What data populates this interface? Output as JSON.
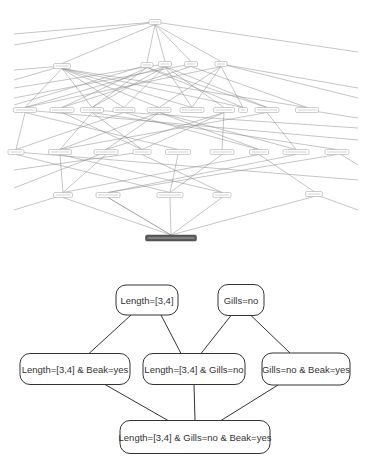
{
  "overview_lattice": {
    "description": "Full concept lattice (labels illegible at this scale)",
    "root": {
      "id": "r0",
      "x": 155,
      "y": 22,
      "w": 12,
      "h": 5,
      "label": ""
    },
    "rows": [
      [
        {
          "id": "a1",
          "x": 62,
          "y": 66,
          "w": 17,
          "h": 5,
          "label": ""
        },
        {
          "id": "a2",
          "x": 147,
          "y": 65,
          "w": 12,
          "h": 5,
          "label": ""
        },
        {
          "id": "a3",
          "x": 165,
          "y": 64,
          "w": 13,
          "h": 5,
          "label": ""
        },
        {
          "id": "a4",
          "x": 191,
          "y": 64,
          "w": 13,
          "h": 5,
          "label": ""
        },
        {
          "id": "a5",
          "x": 221,
          "y": 64,
          "w": 12,
          "h": 5,
          "label": ""
        }
      ],
      [
        {
          "id": "b1",
          "x": 25,
          "y": 110,
          "w": 23,
          "h": 5,
          "label": ""
        },
        {
          "id": "b2",
          "x": 62,
          "y": 110,
          "w": 24,
          "h": 5,
          "label": ""
        },
        {
          "id": "b3",
          "x": 92,
          "y": 110,
          "w": 23,
          "h": 5,
          "label": ""
        },
        {
          "id": "b4",
          "x": 124,
          "y": 110,
          "w": 22,
          "h": 5,
          "label": ""
        },
        {
          "id": "b5",
          "x": 159,
          "y": 110,
          "w": 24,
          "h": 5,
          "label": ""
        },
        {
          "id": "b6",
          "x": 192,
          "y": 110,
          "w": 24,
          "h": 5,
          "label": ""
        },
        {
          "id": "b7",
          "x": 224,
          "y": 110,
          "w": 21,
          "h": 5,
          "label": ""
        },
        {
          "id": "b8",
          "x": 243,
          "y": 110,
          "w": 9,
          "h": 5,
          "label": ""
        },
        {
          "id": "b9",
          "x": 267,
          "y": 110,
          "w": 24,
          "h": 5,
          "label": ""
        },
        {
          "id": "b10",
          "x": 307,
          "y": 110,
          "w": 23,
          "h": 5,
          "label": ""
        }
      ],
      [
        {
          "id": "c1",
          "x": 16,
          "y": 152,
          "w": 16,
          "h": 5,
          "label": ""
        },
        {
          "id": "c2",
          "x": 60,
          "y": 152,
          "w": 23,
          "h": 5,
          "label": ""
        },
        {
          "id": "c3",
          "x": 106,
          "y": 152,
          "w": 24,
          "h": 5,
          "label": ""
        },
        {
          "id": "c4",
          "x": 142,
          "y": 152,
          "w": 18,
          "h": 5,
          "label": ""
        },
        {
          "id": "c5",
          "x": 178,
          "y": 152,
          "w": 25,
          "h": 5,
          "label": ""
        },
        {
          "id": "c6",
          "x": 222,
          "y": 152,
          "w": 24,
          "h": 5,
          "label": ""
        },
        {
          "id": "c7",
          "x": 259,
          "y": 152,
          "w": 19,
          "h": 5,
          "label": ""
        },
        {
          "id": "c8",
          "x": 296,
          "y": 152,
          "w": 26,
          "h": 5,
          "label": ""
        },
        {
          "id": "c9",
          "x": 337,
          "y": 152,
          "w": 24,
          "h": 5,
          "label": ""
        }
      ],
      [
        {
          "id": "d1",
          "x": 63,
          "y": 195,
          "w": 19,
          "h": 5,
          "label": ""
        },
        {
          "id": "d2",
          "x": 108,
          "y": 195,
          "w": 24,
          "h": 5,
          "label": ""
        },
        {
          "id": "d3",
          "x": 170,
          "y": 195,
          "w": 26,
          "h": 5,
          "label": ""
        },
        {
          "id": "d4",
          "x": 222,
          "y": 195,
          "w": 18,
          "h": 5,
          "label": ""
        },
        {
          "id": "d5",
          "x": 314,
          "y": 194,
          "w": 17,
          "h": 5,
          "label": ""
        }
      ]
    ],
    "bottom": {
      "id": "z0",
      "x": 171,
      "y": 238,
      "w": 51,
      "h": 6,
      "label": "",
      "highlighted": true
    },
    "colors": {
      "edge": "#8a8a8a",
      "node_stroke": "#9a9a9a",
      "highlight_fill": "#5a5a5a"
    }
  },
  "detail_lattice": {
    "nodes": [
      {
        "id": "n1",
        "label": "Length=[3,4]",
        "cx": 147,
        "cy": 300,
        "w": 62,
        "h": 30
      },
      {
        "id": "n2",
        "label": "Gills=no",
        "cx": 241,
        "cy": 300,
        "w": 46,
        "h": 31
      },
      {
        "id": "n3",
        "label": "Length=[3,4] & Beak=yes",
        "cx": 75,
        "cy": 369,
        "w": 110,
        "h": 31
      },
      {
        "id": "n4",
        "label": "Length=[3,4] & Gills=no",
        "cx": 194,
        "cy": 369,
        "w": 102,
        "h": 31
      },
      {
        "id": "n5",
        "label": "Gills=no & Beak=yes",
        "cx": 306,
        "cy": 369,
        "w": 88,
        "h": 32
      },
      {
        "id": "n6",
        "label": "Length=[3,4] & Gills=no & Beak=yes",
        "cx": 195,
        "cy": 437,
        "w": 150,
        "h": 33
      }
    ],
    "edges": [
      [
        "n1",
        "n3"
      ],
      [
        "n1",
        "n4"
      ],
      [
        "n2",
        "n4"
      ],
      [
        "n2",
        "n5"
      ],
      [
        "n3",
        "n6"
      ],
      [
        "n4",
        "n6"
      ],
      [
        "n5",
        "n6"
      ]
    ],
    "colors": {
      "edge": "#333333",
      "node_stroke": "#333333",
      "text": "#333333"
    }
  }
}
